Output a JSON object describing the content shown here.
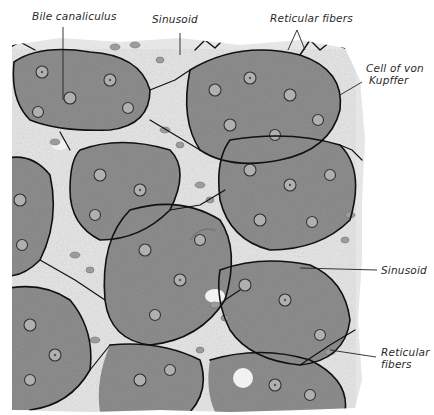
{
  "figure": {
    "labels": [
      {
        "id": "bile-canaliculus",
        "text": "Bile canaliculus",
        "x": 32,
        "y": 14
      },
      {
        "id": "sinusoid-top",
        "text": "Sinusoid",
        "x": 152,
        "y": 17
      },
      {
        "id": "reticular-fibers-top",
        "text": "Reticular fibers",
        "x": 270,
        "y": 16
      },
      {
        "id": "cell-of-von-kupffer",
        "line1": "Cell of von",
        "line2": "Kupffer",
        "x": 366,
        "y": 66
      },
      {
        "id": "sinusoid-right",
        "text": "Sinusoid",
        "x": 381,
        "y": 264
      },
      {
        "id": "reticular-fibers-right",
        "line1": "Reticular",
        "line2": "fibers",
        "x": 381,
        "y": 348
      }
    ],
    "colors": {
      "cell_fill": "#8d8d8d",
      "cell_light": "#b5b5b5",
      "sinusoid_bg": "#e4e4e4",
      "fiber": "#111111",
      "nucleus": "#a8a8a8",
      "rbc": "#9a9a9a"
    }
  }
}
